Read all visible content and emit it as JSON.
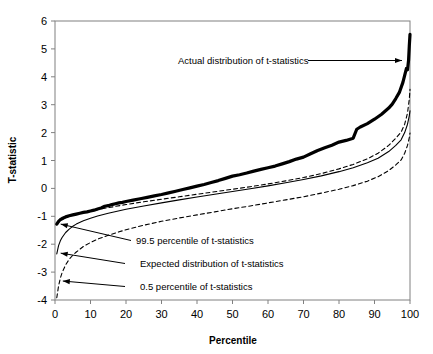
{
  "chart_data": {
    "type": "line",
    "title": "",
    "xlabel": "Percentile",
    "ylabel": "T-statistic",
    "xlim": [
      0,
      100
    ],
    "ylim": [
      -4,
      6
    ],
    "xticks": [
      0,
      10,
      20,
      30,
      40,
      50,
      60,
      70,
      80,
      90,
      100
    ],
    "yticks": [
      -4,
      -3,
      -2,
      -1,
      0,
      1,
      2,
      3,
      4,
      5,
      6
    ],
    "grid": false,
    "legend_position": "inline-annotations",
    "annotations": [
      {
        "label": "Actual distribution of t-statistics",
        "target_x": 97,
        "target_y": 4.35
      },
      {
        "label": "99.5 percentile of t-statistics",
        "target_x": 1.5,
        "target_y": -1.25
      },
      {
        "label": "Expected distribution of t-statistics",
        "target_x": 1.5,
        "target_y": -2.3
      },
      {
        "label": "0.5 percentile of t-statistics",
        "target_x": 2.0,
        "target_y": -3.3
      }
    ],
    "series": [
      {
        "name": "Actual distribution of t-statistics",
        "style": "thick-solid",
        "color": "#000000",
        "x": [
          0.5,
          1,
          1.5,
          2,
          3,
          4,
          5,
          6,
          7,
          8,
          9,
          10,
          11,
          12,
          13,
          14,
          15,
          16,
          17,
          18,
          19,
          20,
          22,
          24,
          26,
          28,
          30,
          32,
          34,
          36,
          38,
          40,
          42,
          44,
          46,
          48,
          50,
          52,
          54,
          56,
          58,
          60,
          62,
          64,
          66,
          68,
          70,
          72,
          74,
          76,
          78,
          80,
          82,
          84,
          85,
          86,
          88,
          90,
          92,
          94,
          95,
          96,
          97,
          98,
          98.5,
          99,
          99.3,
          99.6,
          99.8,
          100
        ],
        "y": [
          -1.28,
          -1.18,
          -1.12,
          -1.08,
          -1.02,
          -0.98,
          -0.95,
          -0.92,
          -0.89,
          -0.86,
          -0.84,
          -0.81,
          -0.78,
          -0.74,
          -0.7,
          -0.64,
          -0.62,
          -0.58,
          -0.55,
          -0.52,
          -0.5,
          -0.47,
          -0.42,
          -0.37,
          -0.32,
          -0.27,
          -0.22,
          -0.16,
          -0.1,
          -0.04,
          0.02,
          0.08,
          0.14,
          0.21,
          0.28,
          0.36,
          0.44,
          0.49,
          0.55,
          0.62,
          0.68,
          0.74,
          0.8,
          0.88,
          0.96,
          1.05,
          1.12,
          1.24,
          1.36,
          1.46,
          1.55,
          1.66,
          1.72,
          1.8,
          2.12,
          2.2,
          2.32,
          2.48,
          2.66,
          2.88,
          3.02,
          3.22,
          3.44,
          3.8,
          4.05,
          4.3,
          4.25,
          4.6,
          5.1,
          5.52
        ]
      },
      {
        "name": "99.5 percentile of t-statistics",
        "style": "dashed",
        "color": "#000000",
        "x": [
          0.5,
          1,
          2,
          3,
          4,
          5,
          6,
          8,
          10,
          12,
          15,
          20,
          25,
          30,
          35,
          40,
          45,
          50,
          55,
          60,
          65,
          70,
          75,
          80,
          84,
          88,
          91,
          94,
          96,
          97.5,
          98.5,
          99.3,
          99.8,
          100
        ],
        "y": [
          -1.3,
          -1.22,
          -1.12,
          -1.05,
          -1.0,
          -0.96,
          -0.92,
          -0.86,
          -0.81,
          -0.76,
          -0.69,
          -0.58,
          -0.48,
          -0.39,
          -0.3,
          -0.21,
          -0.12,
          -0.03,
          0.06,
          0.16,
          0.27,
          0.39,
          0.53,
          0.7,
          0.86,
          1.06,
          1.26,
          1.54,
          1.8,
          2.02,
          2.3,
          2.7,
          3.2,
          3.55
        ]
      },
      {
        "name": "Expected distribution of t-statistics",
        "style": "thin-solid",
        "color": "#000000",
        "x": [
          0.5,
          1,
          1.5,
          2,
          3,
          4,
          5,
          6,
          8,
          10,
          12,
          15,
          20,
          25,
          30,
          35,
          40,
          45,
          50,
          55,
          60,
          65,
          70,
          75,
          80,
          84,
          88,
          91,
          94,
          96,
          97.5,
          98.5,
          99.3,
          99.8,
          100
        ],
        "y": [
          -2.35,
          -2.05,
          -1.88,
          -1.76,
          -1.58,
          -1.46,
          -1.36,
          -1.28,
          -1.16,
          -1.07,
          -0.99,
          -0.89,
          -0.75,
          -0.63,
          -0.52,
          -0.41,
          -0.31,
          -0.21,
          -0.11,
          -0.01,
          0.09,
          0.2,
          0.32,
          0.45,
          0.6,
          0.74,
          0.92,
          1.08,
          1.32,
          1.54,
          1.74,
          2.0,
          2.3,
          2.6,
          2.78
        ]
      },
      {
        "name": "0.5 percentile of t-statistics",
        "style": "dashed",
        "color": "#000000",
        "x": [
          0.5,
          1,
          1.5,
          2,
          3,
          4,
          5,
          6,
          8,
          10,
          12,
          15,
          20,
          25,
          30,
          35,
          40,
          45,
          50,
          55,
          60,
          65,
          70,
          75,
          80,
          84,
          88,
          91,
          94,
          96,
          97.5,
          98.5,
          99.3,
          99.8,
          100
        ],
        "y": [
          -3.92,
          -3.5,
          -3.22,
          -3.02,
          -2.74,
          -2.54,
          -2.4,
          -2.28,
          -2.08,
          -1.94,
          -1.82,
          -1.68,
          -1.48,
          -1.32,
          -1.18,
          -1.06,
          -0.95,
          -0.84,
          -0.73,
          -0.63,
          -0.52,
          -0.41,
          -0.3,
          -0.17,
          -0.03,
          0.1,
          0.26,
          0.42,
          0.64,
          0.84,
          1.02,
          1.26,
          1.54,
          1.82,
          1.98
        ]
      }
    ]
  },
  "axes": {
    "x_title": "Percentile",
    "y_title": "T-statistic"
  }
}
